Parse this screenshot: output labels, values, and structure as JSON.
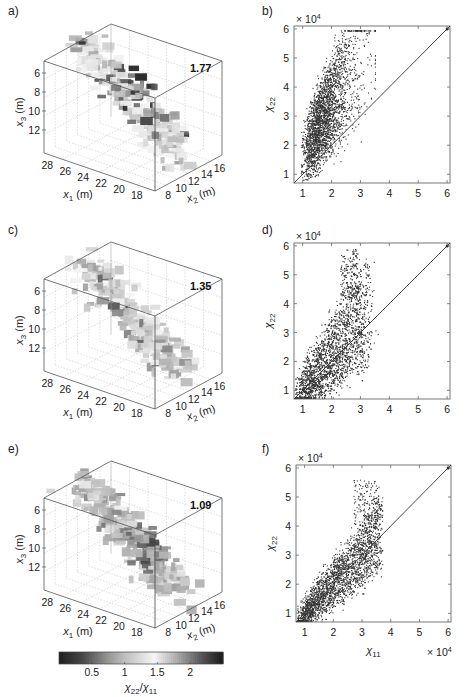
{
  "figure": {
    "panels": [
      "a)",
      "b)",
      "c)",
      "d)",
      "e)",
      "f)"
    ]
  },
  "chart_data": [
    {
      "panel": "a)",
      "type": "3d-volume",
      "annotation": "1.77",
      "axes": {
        "x1": {
          "label": "x1 (m)",
          "ticks": [
            "28",
            "26",
            "24",
            "22",
            "20",
            "18"
          ]
        },
        "x2": {
          "label": "x2 (m)",
          "ticks": [
            "8",
            "10",
            "12",
            "14",
            "16"
          ]
        },
        "x3": {
          "label": "x3 (m)",
          "ticks": [
            "6",
            "8",
            "10",
            "12"
          ]
        }
      },
      "colormap_variable": "χ22/χ11"
    },
    {
      "panel": "b)",
      "type": "scatter",
      "xlabel": "",
      "ylabel": "χ22",
      "x_ticks": [
        "1",
        "2",
        "3",
        "4",
        "5",
        "6"
      ],
      "y_ticks": [
        "1",
        "2",
        "3",
        "4",
        "5",
        "6"
      ],
      "x_multiplier": "",
      "y_multiplier": "× 10^4",
      "xlim": [
        0.7,
        6.1
      ],
      "ylim": [
        0.7,
        6.1
      ],
      "reference_line": "y = x",
      "cloud": {
        "x_range": [
          0.8,
          3.6
        ],
        "y_range": [
          0.8,
          5.9
        ],
        "center": [
          1.9,
          3.1
        ],
        "ratio_mean": 1.77
      }
    },
    {
      "panel": "c)",
      "type": "3d-volume",
      "annotation": "1.35",
      "axes": {
        "x1": {
          "label": "x1 (m)",
          "ticks": [
            "28",
            "26",
            "24",
            "22",
            "20",
            "18"
          ]
        },
        "x2": {
          "label": "x2 (m)",
          "ticks": [
            "8",
            "10",
            "12",
            "14",
            "16"
          ]
        },
        "x3": {
          "label": "x3 (m)",
          "ticks": [
            "6",
            "8",
            "10",
            "12"
          ]
        }
      },
      "colormap_variable": "χ22/χ11"
    },
    {
      "panel": "d)",
      "type": "scatter",
      "xlabel": "",
      "ylabel": "χ22",
      "x_ticks": [
        "1",
        "2",
        "3",
        "4",
        "5",
        "6"
      ],
      "y_ticks": [
        "1",
        "2",
        "3",
        "4",
        "5",
        "6"
      ],
      "x_multiplier": "",
      "y_multiplier": "× 10^4",
      "xlim": [
        0.7,
        6.1
      ],
      "ylim": [
        0.7,
        6.1
      ],
      "reference_line": "y = x",
      "cloud": {
        "x_range": [
          0.9,
          3.5
        ],
        "y_range": [
          0.9,
          5.9
        ],
        "center": [
          2.0,
          2.6
        ],
        "ratio_mean": 1.35
      }
    },
    {
      "panel": "e)",
      "type": "3d-volume",
      "annotation": "1.09",
      "axes": {
        "x1": {
          "label": "x1 (m)",
          "ticks": [
            "28",
            "26",
            "24",
            "22",
            "20",
            "18"
          ]
        },
        "x2": {
          "label": "x2 (m)",
          "ticks": [
            "8",
            "10",
            "12",
            "14",
            "16"
          ]
        },
        "x3": {
          "label": "x3 (m)",
          "ticks": [
            "6",
            "8",
            "10",
            "12"
          ]
        }
      },
      "colormap_variable": "χ22/χ11"
    },
    {
      "panel": "f)",
      "type": "scatter",
      "xlabel": "χ11",
      "ylabel": "χ22",
      "x_ticks": [
        "1",
        "2",
        "3",
        "4",
        "5",
        "6"
      ],
      "y_ticks": [
        "1",
        "2",
        "3",
        "4",
        "5",
        "6"
      ],
      "x_multiplier": "× 10^4",
      "y_multiplier": "× 10^4",
      "xlim": [
        0.7,
        6.1
      ],
      "ylim": [
        0.7,
        6.1
      ],
      "reference_line": "y = x",
      "cloud": {
        "x_range": [
          0.8,
          3.7
        ],
        "y_range": [
          0.8,
          5.7
        ],
        "center": [
          2.0,
          2.2
        ],
        "ratio_mean": 1.09
      }
    },
    {
      "type": "colorbar",
      "label": "χ22/χ11",
      "ticks": [
        "0.5",
        "1",
        "1.5",
        "2"
      ],
      "range": [
        0,
        2.5
      ]
    }
  ],
  "labels": {
    "mult": "× 10",
    "exp": "4",
    "chi": "χ",
    "sub22": "22",
    "sub11": "11",
    "slash": "/",
    "x": "x",
    "m": " (m)",
    "s1": "1",
    "s2": "2",
    "s3": "3"
  }
}
